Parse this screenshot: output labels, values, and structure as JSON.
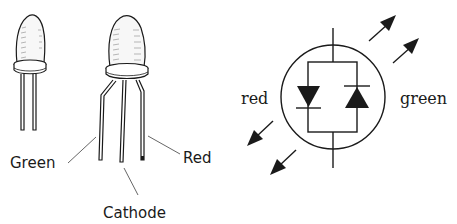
{
  "diagram": {
    "type": "bicolor-led-illustration",
    "left_panel": {
      "leds": [
        {
          "name": "two-lead-led",
          "leads": 2
        },
        {
          "name": "three-lead-led",
          "leads": 3
        }
      ],
      "labels": {
        "green": "Green",
        "cathode": "Cathode",
        "red": "Red"
      }
    },
    "right_panel": {
      "symbol": "bicolor-led-schematic",
      "labels": {
        "red": "red",
        "green": "green"
      }
    }
  },
  "colors": {
    "ink": "#1a1a1a",
    "background": "#ffffff",
    "shading": "#9a9a9a"
  }
}
